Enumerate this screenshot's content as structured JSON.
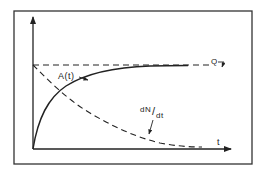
{
  "diagram": {
    "type": "line-sketch",
    "frame": true,
    "colors": {
      "ink": "#222222",
      "background": "#ffffff"
    },
    "axes": {
      "y_axis": {
        "label": "",
        "arrow": true
      },
      "x_axis": {
        "label": "t",
        "arrow": true
      }
    },
    "curves": [
      {
        "name": "A(t)",
        "style": "solid",
        "shape": "rising saturating curve approaching Q"
      },
      {
        "name": "dN/dt",
        "style": "dashed",
        "shape": "decaying curve from Q toward zero"
      },
      {
        "name": "Q",
        "style": "dashed",
        "shape": "horizontal asymptote"
      }
    ],
    "labels": {
      "a_of_t": "A(t)",
      "dn_dt_num": "dN",
      "dn_dt_slash": "/",
      "dn_dt_den": "dt",
      "q": "Q",
      "t": "t"
    }
  }
}
